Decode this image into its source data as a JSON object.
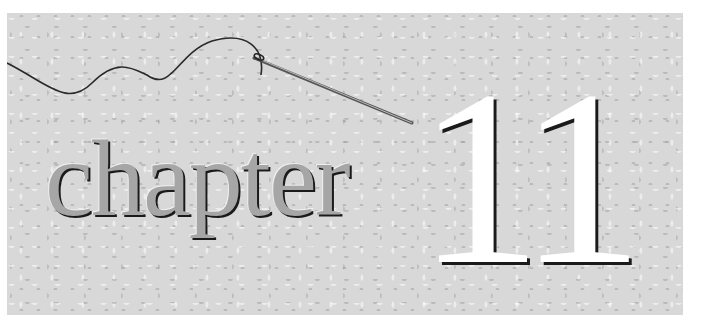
{
  "banner": {
    "word": "chapter",
    "number": "11",
    "decoration": "needle-and-thread-icon"
  },
  "colors": {
    "background": "#ffffff",
    "panel": "#d8d8d8",
    "word_fill": "#a6a6a6",
    "number_fill": "#ffffff",
    "shadow": "#1a1a1a",
    "thread": "#2a2a2a"
  }
}
